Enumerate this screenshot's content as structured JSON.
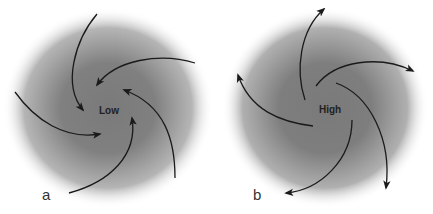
{
  "panels": [
    {
      "id": "a",
      "label": "a",
      "center_label": "Low",
      "flow": "inward",
      "rotation": "counterclockwise"
    },
    {
      "id": "b",
      "label": "b",
      "center_label": "High",
      "flow": "outward",
      "rotation": "clockwise"
    }
  ],
  "colors": {
    "shading": "#6e6e6e",
    "arrow": "#1a1a1a",
    "background": "#ffffff"
  }
}
